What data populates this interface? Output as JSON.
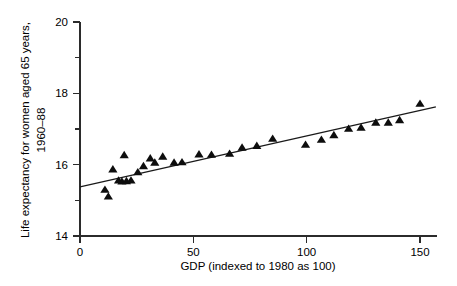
{
  "chart_data": {
    "type": "scatter",
    "title": "",
    "xlabel": "GDP (indexed to 1980 as 100)",
    "ylabel_line1": "Life expectancy for women aged 65 years,",
    "ylabel_line2": "1960–88",
    "xlim": [
      0,
      150
    ],
    "ylim": [
      14,
      20
    ],
    "xticks": [
      0,
      50,
      100,
      150
    ],
    "xtick_labels": [
      "0",
      "50",
      "100",
      "150"
    ],
    "yticks": [
      14,
      16,
      18,
      20
    ],
    "ytick_labels": [
      "14",
      "16",
      "18",
      "20"
    ],
    "yticks_minor": [
      15,
      17,
      19
    ],
    "grid": false,
    "legend": false,
    "marker": "triangle-up",
    "marker_color": "#0d0d0d",
    "line_color": "#1a1a1a",
    "points": [
      {
        "x": 11.0,
        "y": 15.29
      },
      {
        "x": 12.5,
        "y": 15.1
      },
      {
        "x": 14.5,
        "y": 15.86
      },
      {
        "x": 17.0,
        "y": 15.55
      },
      {
        "x": 18.5,
        "y": 15.52
      },
      {
        "x": 19.5,
        "y": 16.26
      },
      {
        "x": 20.5,
        "y": 15.53
      },
      {
        "x": 22.5,
        "y": 15.55
      },
      {
        "x": 25.5,
        "y": 15.78
      },
      {
        "x": 28.0,
        "y": 15.95
      },
      {
        "x": 31.0,
        "y": 16.17
      },
      {
        "x": 33.0,
        "y": 16.05
      },
      {
        "x": 36.5,
        "y": 16.22
      },
      {
        "x": 41.5,
        "y": 16.05
      },
      {
        "x": 45.0,
        "y": 16.06
      },
      {
        "x": 52.5,
        "y": 16.28
      },
      {
        "x": 58.0,
        "y": 16.27
      },
      {
        "x": 66.0,
        "y": 16.3
      },
      {
        "x": 71.5,
        "y": 16.47
      },
      {
        "x": 78.0,
        "y": 16.52
      },
      {
        "x": 85.0,
        "y": 16.72
      },
      {
        "x": 99.5,
        "y": 16.55
      },
      {
        "x": 106.5,
        "y": 16.69
      },
      {
        "x": 112.0,
        "y": 16.82
      },
      {
        "x": 118.5,
        "y": 17.0
      },
      {
        "x": 124.0,
        "y": 17.03
      },
      {
        "x": 130.5,
        "y": 17.17
      },
      {
        "x": 136.0,
        "y": 17.17
      },
      {
        "x": 141.0,
        "y": 17.24
      },
      {
        "x": 150.0,
        "y": 17.7
      }
    ],
    "fit_line": {
      "x_start": 0,
      "y_start": 15.38,
      "x_end": 157,
      "y_end": 17.62
    }
  }
}
